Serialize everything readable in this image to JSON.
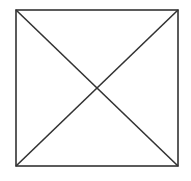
{
  "diagram": {
    "shape": "square-with-diagonals",
    "stroke_color": "#333333",
    "background": "#ffffff",
    "square": {
      "x1": 16,
      "y1": 10,
      "x2": 178,
      "y2": 166
    },
    "diagonals": [
      {
        "from": "top-left",
        "to": "bottom-right"
      },
      {
        "from": "top-right",
        "to": "bottom-left"
      }
    ]
  }
}
